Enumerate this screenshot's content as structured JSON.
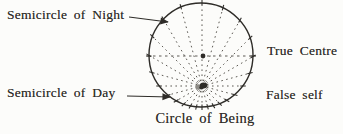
{
  "figure": {
    "labels": {
      "night": "Semicircle of Night",
      "day": "Semicircle of Day",
      "true_centre": "True Centre",
      "false_self": "False self",
      "caption": "Circle of Being"
    },
    "colors": {
      "paper": "#fcfcfa",
      "ink": "#2e2c28",
      "ray": "#55524c",
      "false_self_halo": "#8d8b85"
    },
    "geometry": {
      "circle": {
        "cx": 201,
        "cy": 55,
        "r": 52
      },
      "true_centre_dot": {
        "x": 203,
        "y": 56,
        "r": 2.4
      },
      "false_self_dot": {
        "x": 202,
        "y": 86
      },
      "rays": {
        "count": 24,
        "overshoot": 3,
        "dash": "1.6 3.4"
      },
      "axis": {
        "y": 56,
        "dash": "2.5 3.5"
      },
      "arrows": {
        "night": {
          "x1": 129,
          "y1": 17,
          "x2": 168,
          "y2": 22
        },
        "day": {
          "x1": 127,
          "y1": 96,
          "x2": 170,
          "y2": 97
        }
      }
    }
  }
}
